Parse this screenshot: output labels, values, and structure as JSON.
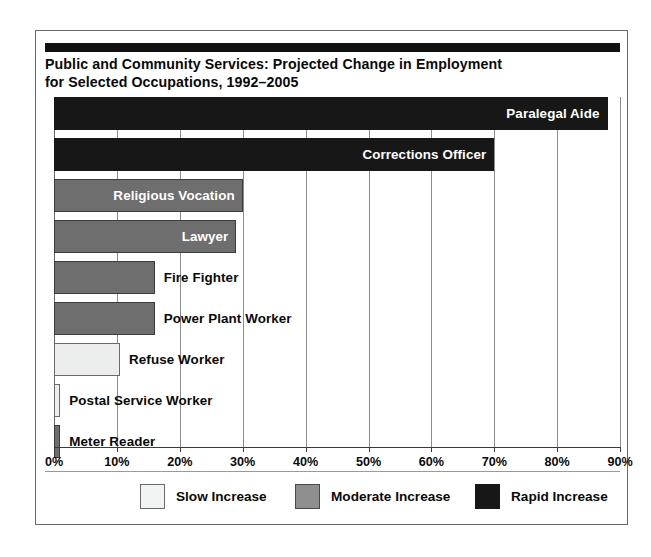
{
  "figure": {
    "title_line1": "Public and Community Services: Projected Change in Employment",
    "title_line2": "for Selected Occupations, 1992–2005"
  },
  "chart_data": {
    "type": "bar",
    "orientation": "horizontal",
    "xlabel": "",
    "ylabel": "",
    "xlim": [
      0,
      90
    ],
    "grid": true,
    "legend_position": "bottom",
    "categories": [
      "Paralegal Aide",
      "Corrections Officer",
      "Religious Vocation",
      "Lawyer",
      "Fire Fighter",
      "Power Plant Worker",
      "Refuse Worker",
      "Postal Service Worker",
      "Meter Reader"
    ],
    "values": [
      88,
      70,
      30,
      29,
      16,
      16,
      10.5,
      1,
      1
    ],
    "value_unit": "%",
    "bar_categories": [
      "Rapid Increase",
      "Rapid Increase",
      "Moderate Increase",
      "Moderate Increase",
      "Moderate Increase",
      "Moderate Increase",
      "Slow Increase",
      "Slow Increase",
      "Moderate Increase"
    ],
    "label_placement": [
      "inside",
      "inside",
      "inside",
      "inside",
      "outside",
      "outside",
      "outside",
      "outside",
      "outside"
    ],
    "xticks": [
      0,
      10,
      20,
      30,
      40,
      50,
      60,
      70,
      80,
      90
    ],
    "xtick_labels": [
      "0%",
      "10%",
      "20%",
      "30%",
      "40%",
      "50%",
      "60%",
      "70%",
      "80%",
      "90%"
    ],
    "legend": [
      {
        "label": "Slow Increase",
        "key": "slow",
        "color": "#f2f4f3"
      },
      {
        "label": "Moderate Increase",
        "key": "moderate",
        "color": "#8f8f8f"
      },
      {
        "label": "Rapid Increase",
        "key": "rapid",
        "color": "#171717"
      }
    ]
  },
  "colors": {
    "slow": "#f2f4f3",
    "moderate": "#6e6e6e",
    "rapid": "#171717",
    "frame": "#6a6a6a",
    "gridline": "#8c8c8c",
    "text": "#0a0a0a"
  }
}
